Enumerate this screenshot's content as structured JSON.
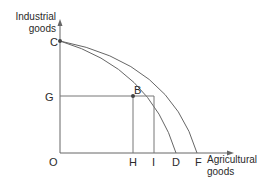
{
  "diagram": {
    "type": "production-possibility-frontier",
    "y_axis_label_line1": "Industrial",
    "y_axis_label_line2": "goods",
    "x_axis_label_line1": "Agricultural",
    "x_axis_label_line2": "goods",
    "points": {
      "C": "C",
      "G": "G",
      "B": "B",
      "O": "O",
      "H": "H",
      "I": "I",
      "D": "D",
      "F": "F"
    },
    "curves": [
      {
        "name": "inner-frontier",
        "from": "C",
        "to": "D",
        "through": "B"
      },
      {
        "name": "outer-frontier",
        "from": "C",
        "to": "F"
      }
    ],
    "guide_lines": [
      {
        "from": "G",
        "to": "B",
        "orientation": "horizontal"
      },
      {
        "from": "B",
        "to": "H",
        "orientation": "vertical"
      },
      {
        "from": "I",
        "to": "outer-frontier",
        "orientation": "vertical"
      }
    ],
    "colors": {
      "line": "#555555",
      "text": "#2a2a2a",
      "point": "#444444"
    }
  }
}
